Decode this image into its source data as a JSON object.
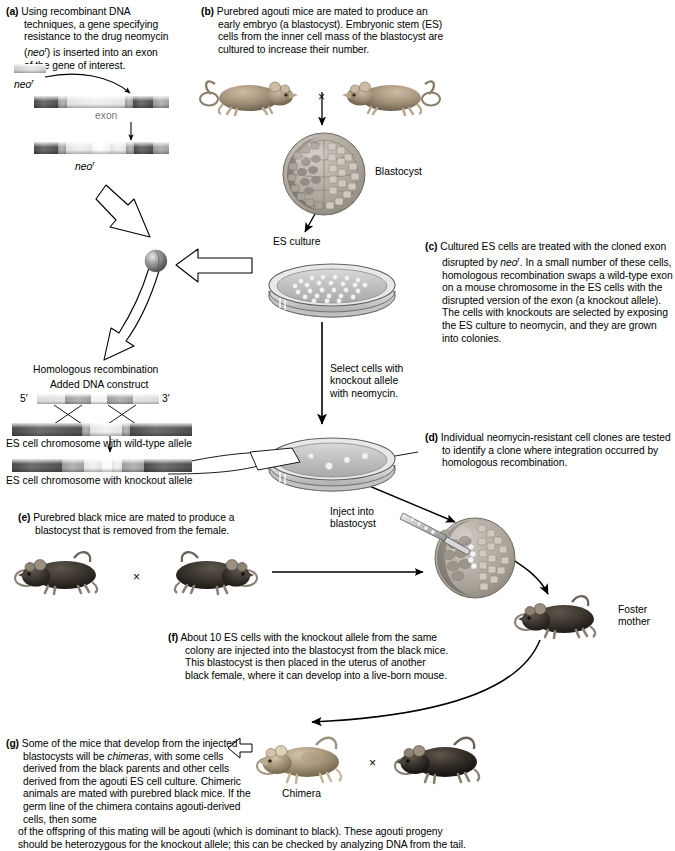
{
  "panels": {
    "a": {
      "label": "(a)",
      "text": "Using recombinant DNA techniques, a gene specifying resistance to the drug neomycin (neo r) is inserted into an exon of the gene of interest.",
      "lines": [
        "Using recombinant DNA",
        "techniques, a gene specifying",
        "resistance to the drug neomycin",
        "(neoʳ) is inserted into an exon",
        "of the gene of interest."
      ]
    },
    "b": {
      "label": "(b)",
      "lines": [
        "Purebred agouti mice are mated to produce",
        "an early embryo (a blastocyst). Embryonic",
        "stem (ES) cells from the inner cell mass of",
        "the blastocyst are cultured to increase their",
        "number."
      ]
    },
    "c": {
      "label": "(c)",
      "lines": [
        "Cultured ES cells are treated with the cloned",
        "exon disrupted by neoʳ. In a small number of",
        "these cells, homologous recombination swaps",
        "a wild-type exon on a mouse chromosome in",
        "the ES cells with the disrupted version of the",
        "exon (a knockout allele). The cells with",
        "knockouts are selected by exposing the ES",
        "culture to neomycin, and they are grown into",
        "colonies."
      ]
    },
    "d": {
      "label": "(d)",
      "lines": [
        "Individual neomycin-resistant",
        "cell clones are tested to identify a",
        "clone where integration occurred",
        "by homologous recombination."
      ]
    },
    "e": {
      "label": "(e)",
      "lines": [
        "Purebred black mice are mated to produce",
        "a blastocyst that is removed from the female."
      ]
    },
    "f": {
      "label": "(f)",
      "lines": [
        "About 10 ES cells with the knockout allele from",
        "the same colony are injected into the blastocyst",
        "from the black mice. This blastocyst is then placed",
        "in the uterus of another black female, where it can",
        "develop into a live-born mouse."
      ]
    },
    "g": {
      "label": "(g)",
      "lines": [
        "Some of the mice that develop from the",
        "injected blastocysts will be chimeras, with",
        "some cells derived from the black parents",
        "and other cells derived from the agouti ES",
        "cell culture. Chimeric animals are mated with",
        "purebred black mice. If the germ line of the",
        "chimera contains agouti-derived cells, then some"
      ],
      "wide_lines": [
        "of the offspring of this mating will be agouti (which is dominant to black). These agouti progeny",
        "should be heterozygous for the knockout allele; this can be checked by analyzing DNA from the tail."
      ]
    }
  },
  "labels": {
    "neo_top": "neo",
    "neo_sup": "r",
    "exon": "exon",
    "neo_inserted": "neo",
    "homologous_recombination": "Homologous recombination",
    "added_dna_construct": "Added DNA construct",
    "five_prime": "5′",
    "three_prime": "3′",
    "chr_wildtype": "ES cell chromosome with wild-type allele",
    "chr_knockout": "ES cell chromosome with knockout allele",
    "blastocyst": "Blastocyst",
    "es_culture": "ES culture",
    "select_cells": [
      "Select cells with",
      "knockout allele",
      "with neomycin."
    ],
    "inject_into": [
      "Inject into",
      "blastocyst"
    ],
    "foster_mother": [
      "Foster",
      "mother"
    ],
    "chimera": "Chimera",
    "cross_symbol": "×"
  },
  "colors": {
    "background": "#ffffff",
    "text": "#000000",
    "dna_dark": "#4f4f4f",
    "dna_mid": "#a8a8a8",
    "dna_light": "#ececec",
    "mouse_agouti": "#a89376",
    "mouse_black": "#3a3530",
    "blastocyst_fill": "#b9b3ab",
    "dish_gray": "#c8c8c8",
    "arrow_outline": "#000000"
  }
}
